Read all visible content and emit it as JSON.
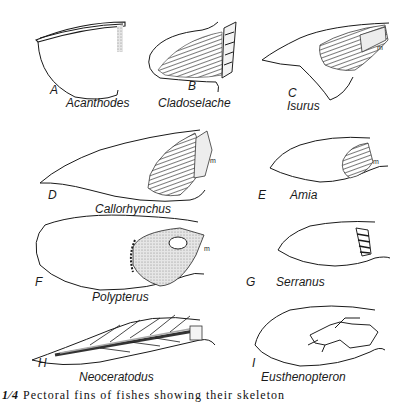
{
  "figure": {
    "panels": [
      {
        "letter": "A",
        "name": "Acanthodes"
      },
      {
        "letter": "B",
        "name": "Cladoselache"
      },
      {
        "letter": "C",
        "name": "Isurus",
        "marker": "m"
      },
      {
        "letter": "D",
        "name": "Callorhynchus",
        "marker": "m"
      },
      {
        "letter": "E",
        "name": "Amia",
        "marker": "m"
      },
      {
        "letter": "F",
        "name": "Polypterus",
        "marker": "m"
      },
      {
        "letter": "G",
        "name": "Serranus"
      },
      {
        "letter": "H",
        "name": "Neoceratodus"
      },
      {
        "letter": "I",
        "name": "Eusthenopteron"
      }
    ],
    "caption": {
      "number": "1⁄4",
      "text": "Pectoral fins of fishes showing their skeleton"
    }
  }
}
